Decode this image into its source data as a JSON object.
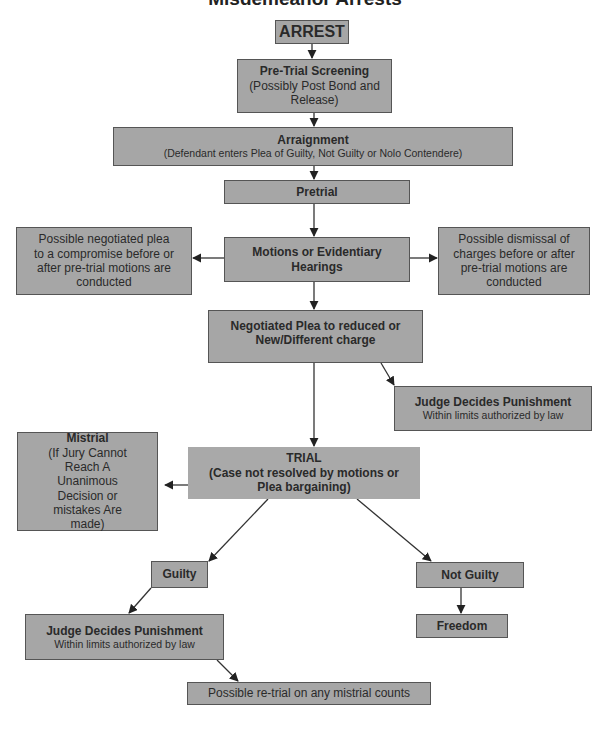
{
  "title": "Misdemeanor Arrests",
  "nodes": {
    "arrest": {
      "label": "ARREST"
    },
    "screening": {
      "title": "Pre-Trial Screening",
      "subtitle": "(Possibly Post Bond and Release)"
    },
    "arraignment": {
      "title": "Arraignment",
      "subtitle": "(Defendant enters Plea of Guilty, Not Guilty or Nolo Contendere)"
    },
    "pretrial": {
      "label": "Pretrial"
    },
    "motions": {
      "label": "Motions or Evidentiary Hearings"
    },
    "negotiated_plea_compromise": {
      "label": "Possible negotiated plea to a compromise before or after pre-trial motions are conducted"
    },
    "dismissal": {
      "label": "Possible dismissal of charges before or after pre-trial motions are conducted"
    },
    "negotiated_plea": {
      "label": "Negotiated Plea to reduced or New/Different charge"
    },
    "judge_upper": {
      "title": "Judge Decides Punishment",
      "subtitle": "Within limits authorized by law"
    },
    "mistrial": {
      "title": "Mistrial",
      "subtitle": "(If Jury Cannot Reach A Unanimous Decision or mistakes Are made)"
    },
    "trial": {
      "title": "TRIAL",
      "subtitle": "(Case not resolved by motions or Plea bargaining)"
    },
    "guilty": {
      "label": "Guilty"
    },
    "not_guilty": {
      "label": "Not Guilty"
    },
    "judge_lower": {
      "title": "Judge Decides Punishment",
      "subtitle": "Within limits authorized by law"
    },
    "freedom": {
      "label": "Freedom"
    },
    "retrial": {
      "label": "Possible re-trial on any mistrial counts"
    }
  },
  "edges": [
    {
      "from": "arrest",
      "to": "screening"
    },
    {
      "from": "screening",
      "to": "arraignment"
    },
    {
      "from": "arraignment",
      "to": "pretrial"
    },
    {
      "from": "pretrial",
      "to": "motions"
    },
    {
      "from": "motions",
      "to": "negotiated_plea_compromise"
    },
    {
      "from": "motions",
      "to": "dismissal"
    },
    {
      "from": "motions",
      "to": "negotiated_plea"
    },
    {
      "from": "negotiated_plea",
      "to": "judge_upper"
    },
    {
      "from": "negotiated_plea",
      "to": "trial"
    },
    {
      "from": "trial",
      "to": "mistrial"
    },
    {
      "from": "trial",
      "to": "guilty"
    },
    {
      "from": "trial",
      "to": "not_guilty"
    },
    {
      "from": "guilty",
      "to": "judge_lower"
    },
    {
      "from": "not_guilty",
      "to": "freedom"
    },
    {
      "from": "judge_lower",
      "to": "retrial"
    }
  ]
}
